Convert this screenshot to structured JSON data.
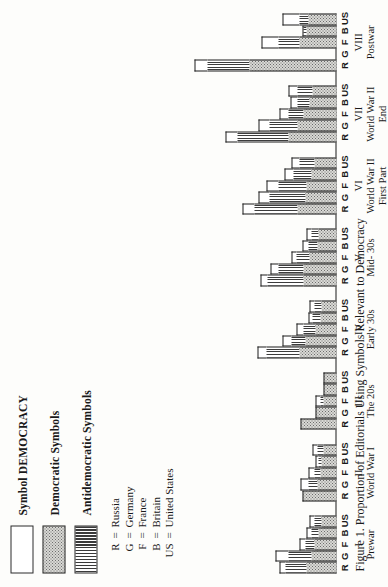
{
  "figure": {
    "caption": "Figure 1.  Proportion of Editorials Using Symbols Relevant to Democracy"
  },
  "legend": {
    "items": [
      {
        "id": "symbol-democracy",
        "label": "Symbol DEMOCRACY",
        "pattern": "white"
      },
      {
        "id": "democratic-symbols",
        "label": "Democratic Symbols",
        "pattern": "stipple"
      },
      {
        "id": "antidemocratic-symbols",
        "label": "Antidemocratic Symbols",
        "pattern": "vertical-lines"
      }
    ]
  },
  "country_key": {
    "rows": [
      {
        "abbr": "R",
        "eq": "=",
        "name": "Russia"
      },
      {
        "abbr": "G",
        "eq": "=",
        "name": "Germany"
      },
      {
        "abbr": "F",
        "eq": "=",
        "name": "France"
      },
      {
        "abbr": "B",
        "eq": "=",
        "name": "Britain"
      },
      {
        "abbr": "US",
        "eq": "=",
        "name": "United States"
      }
    ]
  },
  "chart_data": {
    "type": "bar",
    "title": "Proportion of Editorials Using Symbols Relevant to Democracy",
    "orientation": "vertical-stacked-grouped",
    "xlabel": "",
    "ylabel": "",
    "ylim": [
      0,
      100
    ],
    "grid": false,
    "legend_position": "top-left",
    "stack_order_from_axis": [
      "Democratic Symbols",
      "Antidemocratic Symbols",
      "Symbol DEMOCRACY"
    ],
    "series": [
      {
        "name": "Democratic Symbols",
        "pattern": "stipple"
      },
      {
        "name": "Antidemocratic Symbols",
        "pattern": "vertical-lines"
      },
      {
        "name": "Symbol DEMOCRACY",
        "pattern": "white"
      }
    ],
    "categories": [
      "R",
      "G",
      "F",
      "B",
      "US"
    ],
    "groups": [
      {
        "roman": "I",
        "name": "Prewar",
        "bars": [
          {
            "country": "R",
            "democratic": 20,
            "antidemocratic": 14,
            "symbol_democracy": 4
          },
          {
            "country": "G",
            "democratic": 17,
            "antidemocratic": 15,
            "symbol_democracy": 9
          },
          {
            "country": "F",
            "democratic": 15,
            "antidemocratic": 6,
            "symbol_democracy": 4
          },
          {
            "country": "B",
            "democratic": 12,
            "antidemocratic": 5,
            "symbol_democracy": 3
          },
          {
            "country": "US",
            "democratic": 10,
            "antidemocratic": 5,
            "symbol_democracy": 3
          }
        ]
      },
      {
        "roman": "II",
        "name": "World War I",
        "bars": [
          {
            "country": "R",
            "democratic": 23,
            "antidemocratic": 0,
            "symbol_democracy": 0
          },
          {
            "country": "G",
            "democratic": 13,
            "antidemocratic": 6,
            "symbol_democracy": 5
          },
          {
            "country": "F",
            "democratic": 11,
            "antidemocratic": 4,
            "symbol_democracy": 4
          },
          {
            "country": "B",
            "democratic": 10,
            "antidemocratic": 2,
            "symbol_democracy": 2
          },
          {
            "country": "US",
            "democratic": 9,
            "antidemocratic": 4,
            "symbol_democracy": 3
          }
        ]
      },
      {
        "roman": "III",
        "name": "The 20s",
        "bars": [
          {
            "country": "R",
            "democratic": 24,
            "antidemocratic": 0,
            "symbol_democracy": 0
          },
          {
            "country": "G",
            "democratic": 14,
            "antidemocratic": 0,
            "symbol_democracy": 0
          },
          {
            "country": "F",
            "democratic": 9,
            "antidemocratic": 2,
            "symbol_democracy": 3
          },
          {
            "country": "B",
            "democratic": 9,
            "antidemocratic": 0,
            "symbol_democracy": 0
          },
          {
            "country": "US",
            "democratic": 9,
            "antidemocratic": 0,
            "symbol_democracy": 0
          }
        ]
      },
      {
        "roman": "IV",
        "name": "Early 30s",
        "bars": [
          {
            "country": "R",
            "democratic": 25,
            "antidemocratic": 22,
            "symbol_democracy": 6
          },
          {
            "country": "G",
            "democratic": 21,
            "antidemocratic": 9,
            "symbol_democracy": 6
          },
          {
            "country": "F",
            "democratic": 14,
            "antidemocratic": 8,
            "symbol_democracy": 5
          },
          {
            "country": "B",
            "democratic": 11,
            "antidemocratic": 5,
            "symbol_democracy": 3
          },
          {
            "country": "US",
            "democratic": 10,
            "antidemocratic": 5,
            "symbol_democracy": 3
          }
        ]
      },
      {
        "roman": "V",
        "name": "Mid- 30s",
        "bars": [
          {
            "country": "R",
            "democratic": 22,
            "antidemocratic": 24,
            "symbol_democracy": 5
          },
          {
            "country": "G",
            "democratic": 22,
            "antidemocratic": 17,
            "symbol_democracy": 5
          },
          {
            "country": "F",
            "democratic": 18,
            "antidemocratic": 9,
            "symbol_democracy": 3
          },
          {
            "country": "B",
            "democratic": 13,
            "antidemocratic": 6,
            "symbol_democracy": 4
          },
          {
            "country": "US",
            "democratic": 12,
            "antidemocratic": 5,
            "symbol_democracy": 3
          }
        ]
      },
      {
        "roman": "VI",
        "name": "World War II",
        "name2": "First Part",
        "bars": [
          {
            "country": "R",
            "democratic": 26,
            "antidemocratic": 29,
            "symbol_democracy": 8
          },
          {
            "country": "G",
            "democratic": 21,
            "antidemocratic": 24,
            "symbol_democracy": 7
          },
          {
            "country": "F",
            "democratic": 20,
            "antidemocratic": 19,
            "symbol_democracy": 8
          },
          {
            "country": "B",
            "democratic": 17,
            "antidemocratic": 12,
            "symbol_democracy": 6
          },
          {
            "country": "US",
            "democratic": 15,
            "antidemocratic": 10,
            "symbol_democracy": 5
          }
        ]
      },
      {
        "roman": "VII",
        "name": "World War II",
        "name2": "End",
        "bars": [
          {
            "country": "R",
            "democratic": 32,
            "antidemocratic": 34,
            "symbol_democracy": 8
          },
          {
            "country": "G",
            "democratic": 26,
            "antidemocratic": 19,
            "symbol_democracy": 7
          },
          {
            "country": "F",
            "democratic": 22,
            "antidemocratic": 10,
            "symbol_democracy": 6
          },
          {
            "country": "B",
            "democratic": 18,
            "antidemocratic": 8,
            "symbol_democracy": 5
          },
          {
            "country": "US",
            "democratic": 16,
            "antidemocratic": 10,
            "symbol_democracy": 6
          }
        ]
      },
      {
        "roman": "VIII",
        "name": "Postwar",
        "bars": [
          {
            "country": "R",
            "democratic": 58,
            "antidemocratic": 28,
            "symbol_democracy": 9
          },
          {
            "country": "G",
            "democratic": 0,
            "antidemocratic": 0,
            "symbol_democracy": 0
          },
          {
            "country": "F",
            "democratic": 25,
            "antidemocratic": 14,
            "symbol_democracy": 11
          },
          {
            "country": "B",
            "democratic": 20,
            "antidemocratic": 3,
            "symbol_democracy": 0
          },
          {
            "country": "US",
            "democratic": 19,
            "antidemocratic": 6,
            "symbol_democracy": 11
          }
        ]
      }
    ]
  }
}
